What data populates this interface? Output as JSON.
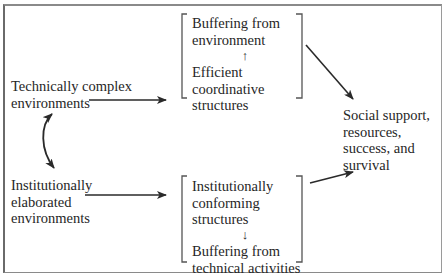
{
  "nodes": {
    "technical_env": [
      "Technically complex",
      "environments"
    ],
    "institutional_env": [
      "Institutionally",
      "elaborated",
      "environments"
    ],
    "top_box": {
      "upper": [
        "Buffering from",
        "environment"
      ],
      "arrow": "↑",
      "lower": [
        "Efficient",
        "coordinative",
        "structures"
      ]
    },
    "bottom_box": {
      "upper": [
        "Institutionally",
        "conforming",
        "structures"
      ],
      "arrow": "↓",
      "lower": [
        "Buffering from",
        "technical activities"
      ]
    },
    "outcome": [
      "Social support,",
      "resources,",
      "success, and",
      "survival"
    ]
  },
  "edges": [
    {
      "from": "technical_env",
      "to": "top_box",
      "type": "arrow"
    },
    {
      "from": "institutional_env",
      "to": "bottom_box",
      "type": "arrow"
    },
    {
      "from": "technical_env",
      "to": "institutional_env",
      "type": "bidirectional-curved"
    },
    {
      "from": "top_box",
      "to": "outcome",
      "type": "arrow"
    },
    {
      "from": "bottom_box",
      "to": "outcome",
      "type": "arrow"
    }
  ]
}
